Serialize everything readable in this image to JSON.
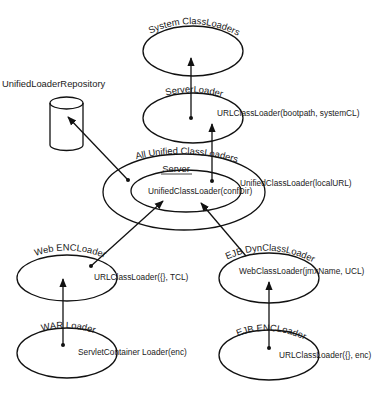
{
  "diagram": {
    "nodes": [
      {
        "id": "system",
        "title": "System ClassLoaders",
        "label": "",
        "cx": 193,
        "cy": 51,
        "rx": 50,
        "ry": 25
      },
      {
        "id": "server_loader",
        "title": "ServerLoader",
        "label": "URLClassLoader(bootpath, systemCL)",
        "cx": 193,
        "cy": 118,
        "rx": 50,
        "ry": 25
      },
      {
        "id": "all_unified",
        "title": "All Unified ClassLoaders",
        "label": "UnifiedClassLoader(localURL)",
        "cx": 184,
        "cy": 192,
        "rx": 81,
        "ry": 38
      },
      {
        "id": "server",
        "title": "Server",
        "label": "UnifiedClassLoader(confDir)",
        "cx": 186,
        "cy": 191,
        "rx": 55,
        "ry": 21
      },
      {
        "id": "web_enc",
        "title": "Web ENCLoader",
        "label": "URLClassLoader({}, TCL)",
        "cx": 67,
        "cy": 278,
        "rx": 50,
        "ry": 23
      },
      {
        "id": "ejb_dyn",
        "title": "EJB DynClassLoader",
        "label": "WebClassLoader(jmxName, UCL)",
        "cx": 269,
        "cy": 278,
        "rx": 50,
        "ry": 25
      },
      {
        "id": "war",
        "title": "WAR Loader",
        "label": "ServletContainer Loader(enc)",
        "cx": 67,
        "cy": 353,
        "rx": 50,
        "ry": 25
      },
      {
        "id": "ejb_enc",
        "title": "EJB ENCLoader",
        "label": "URLClassLoader({}, enc)",
        "cx": 269,
        "cy": 355,
        "rx": 50,
        "ry": 25
      }
    ],
    "repository": {
      "title": "UnifiedLoaderRepository"
    },
    "edges": [
      {
        "from": "server_loader",
        "to": "system"
      },
      {
        "from": "all_unified",
        "to": "server_loader"
      },
      {
        "from": "all_unified",
        "to": "repository"
      },
      {
        "from": "web_enc",
        "to": "server"
      },
      {
        "from": "ejb_dyn",
        "to": "server"
      },
      {
        "from": "war",
        "to": "web_enc"
      },
      {
        "from": "ejb_enc",
        "to": "ejb_dyn"
      }
    ]
  }
}
